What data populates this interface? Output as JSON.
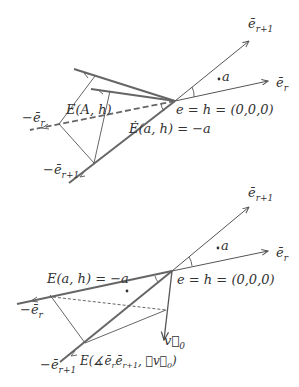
{
  "figure": {
    "colors": {
      "background": "#ffffff",
      "thick_line": "#666666",
      "thin_line": "#555555",
      "text": "#333333"
    },
    "top_panel": {
      "labels": {
        "e_r_plus_1": "e⃗r+1",
        "e_r_plus_1_base": "ē",
        "e_r_plus_1_sub": "r+1",
        "e_r_base": "ē",
        "e_r_sub": "r",
        "point_a": "a",
        "origin": "e = h = (0,0,0)",
        "E_A_h": "E(A, h)",
        "E_dot_a_h": "Ė(a, h) = −a",
        "minus_e_r_base": "−ē",
        "minus_e_r_sub": "r",
        "minus_e_r_plus_1_base": "−ē",
        "minus_e_r_plus_1_sub": "r+1"
      }
    },
    "bottom_panel": {
      "labels": {
        "e_r_plus_1_base": "ē",
        "e_r_plus_1_sub": "r+1",
        "e_r_base": "ē",
        "e_r_sub": "r",
        "point_a": "a",
        "origin": "e = h = (0,0,0)",
        "E_a_h": "E(a, h) = −a",
        "minus_e_r_base": "−ē",
        "minus_e_r_sub": "r",
        "minus_e_r_plus_1_base": "−ē",
        "minus_e_r_plus_1_sub": "r+1",
        "v0_base": "v⃗",
        "v0_sub": "0",
        "E_angle": "E(∡ē",
        "E_angle_sub1": "r",
        "E_angle_mid": "ē",
        "E_angle_sub2": "r+1",
        "E_angle_mid2": ", ∡v⃗",
        "E_angle_sub3": "0",
        "E_angle_end": ")"
      }
    }
  }
}
